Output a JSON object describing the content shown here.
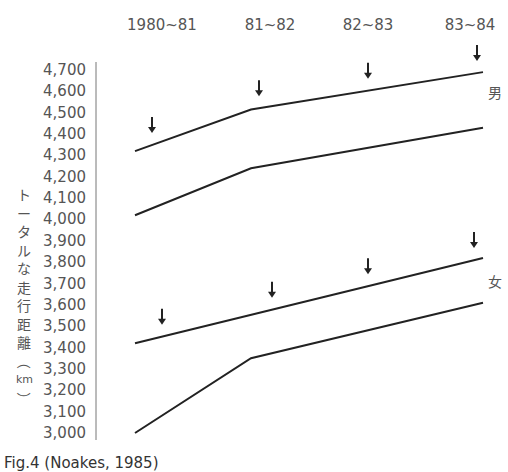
{
  "chart_data": {
    "type": "line",
    "title": "",
    "xlabel": "",
    "ylabel": "トータルな走行距離（km）",
    "categories": [
      "1980~81",
      "81~82",
      "82~83",
      "83~84"
    ],
    "y_ticks": [
      "4,700",
      "4,600",
      "4,500",
      "4,400",
      "4,300",
      "4,200",
      "4,100",
      "4,000",
      "3,900",
      "3,800",
      "3,700",
      "3,600",
      "3,500",
      "3,400",
      "3,300",
      "3,200",
      "3,100",
      "3,000"
    ],
    "ylim": [
      3000,
      4700
    ],
    "grid": false,
    "groups": [
      {
        "name": "男",
        "series": [
          {
            "name": "男 upper",
            "points": [
              [
                0.0,
                4320
              ],
              [
                1.0,
                4515
              ],
              [
                3.0,
                4690
              ]
            ]
          },
          {
            "name": "男 lower",
            "points": [
              [
                0.0,
                4020
              ],
              [
                1.0,
                4240
              ],
              [
                3.0,
                4430
              ]
            ]
          }
        ],
        "arrows_x_index": [
          0,
          1,
          2,
          3
        ]
      },
      {
        "name": "女",
        "series": [
          {
            "name": "女 upper",
            "points": [
              [
                0.0,
                3420
              ],
              [
                3.0,
                3820
              ]
            ]
          },
          {
            "name": "女 lower",
            "points": [
              [
                0.0,
                3000
              ],
              [
                1.0,
                3350
              ],
              [
                3.0,
                3610
              ]
            ]
          }
        ],
        "arrows_x_index": [
          0,
          1,
          2,
          3
        ]
      }
    ],
    "annotations": [
      "↓ markers above upper lines",
      "男",
      "女"
    ]
  },
  "labels": {
    "male": "男",
    "female": "女",
    "ylabel_chars": [
      "ト",
      "ー",
      "タ",
      "ル",
      "な",
      "走",
      "行",
      "距",
      "離",
      "（",
      "km",
      "）"
    ],
    "caption": "Fig.4 (Noakes, 1985)"
  }
}
